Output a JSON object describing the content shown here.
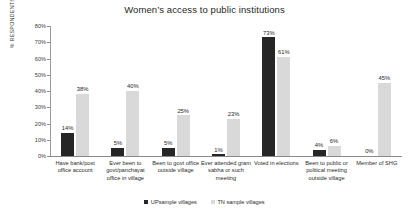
{
  "chart_data": {
    "type": "bar",
    "title": "Women’s access to public institutions",
    "xlabel": "",
    "ylabel": "% RESPONDENTS",
    "ylim": [
      0,
      80
    ],
    "ytick_labels": [
      "0%",
      "10%",
      "20%",
      "30%",
      "40%",
      "50%",
      "60%",
      "70%",
      "80%"
    ],
    "ytick_values": [
      0,
      10,
      20,
      30,
      40,
      50,
      60,
      70,
      80
    ],
    "grid": false,
    "legend_position": "bottom",
    "categories": [
      "Have bank/post office account",
      "Ever been to govt/panchayat office in village",
      "Been to govt office outside village",
      "Ever attended gram sabha or such meeting",
      "Voted in elections",
      "Been to public or political meeting outside village",
      "Member of SHG"
    ],
    "series": [
      {
        "name": "UPsample villages",
        "color": "#262626",
        "values": [
          14,
          5,
          5,
          1,
          73,
          4,
          0
        ],
        "value_labels": [
          "14%",
          "5%",
          "5%",
          "1%",
          "73%",
          "4%",
          "0%"
        ]
      },
      {
        "name": "TN sample villages",
        "color": "#d9d9d9",
        "values": [
          38,
          40,
          25,
          23,
          61,
          6,
          45
        ],
        "value_labels": [
          "38%",
          "40%",
          "25%",
          "23%",
          "61%",
          "6%",
          "45%"
        ]
      }
    ]
  }
}
